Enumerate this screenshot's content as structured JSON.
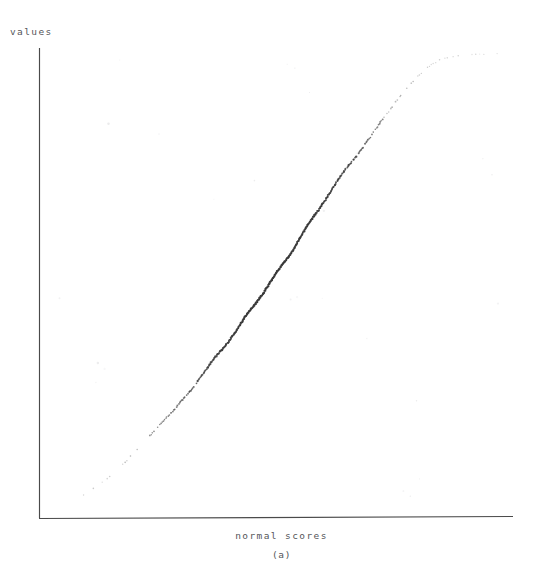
{
  "figure": {
    "caption": "(a)",
    "background_color": "#ffffff",
    "ink_color": "#3a3a3a",
    "axis_color": "#4a4a4a"
  },
  "chart_data": {
    "type": "scatter",
    "title": "",
    "subtitle": "",
    "xlabel": "normal scores",
    "ylabel": "values",
    "annotations": [
      "(a)"
    ],
    "legend": [],
    "legend_position": "none",
    "grid": false,
    "axis_style": "two-sided-open (left spine and bottom spine only, no ticks, no tick labels)",
    "xticks": [],
    "yticks": [],
    "xlim": [
      -3.4,
      3.4
    ],
    "ylim": [
      0,
      1
    ],
    "n_points": 450,
    "marker": "dot",
    "marker_size_px": 1.2,
    "series": [
      {
        "name": "sample quantiles",
        "x": [
          -3.2,
          -3.02,
          -2.86,
          -2.72,
          -2.6,
          -2.49,
          -2.39,
          -2.3,
          -2.22,
          -2.14,
          -2.07,
          -2.0,
          -1.94,
          -1.88,
          -1.82,
          -1.77,
          -1.72,
          -1.67,
          -1.62,
          -1.58,
          -1.53,
          -1.49,
          -1.45,
          -1.41,
          -1.38,
          -1.34,
          -1.3,
          -1.27,
          -1.24,
          -1.2,
          -1.17,
          -1.14,
          -1.11,
          -1.08,
          -1.05,
          -1.02,
          -0.99,
          -0.97,
          -0.94,
          -0.91,
          -0.89,
          -0.86,
          -0.84,
          -0.81,
          -0.79,
          -0.76,
          -0.74,
          -0.72,
          -0.69,
          -0.67,
          -0.65,
          -0.63,
          -0.6,
          -0.58,
          -0.56,
          -0.54,
          -0.52,
          -0.5,
          -0.48,
          -0.46,
          -0.44,
          -0.42,
          -0.4,
          -0.38,
          -0.36,
          -0.34,
          -0.32,
          -0.3,
          -0.28,
          -0.26,
          -0.24,
          -0.22,
          -0.2,
          -0.18,
          -0.16,
          -0.14,
          -0.12,
          -0.1,
          -0.08,
          -0.06,
          -0.04,
          -0.02,
          0.0,
          0.02,
          0.04,
          0.06,
          0.08,
          0.1,
          0.12,
          0.14,
          0.16,
          0.18,
          0.2,
          0.22,
          0.24,
          0.26,
          0.28,
          0.3,
          0.32,
          0.34,
          0.36,
          0.38,
          0.4,
          0.42,
          0.44,
          0.46,
          0.48,
          0.5,
          0.52,
          0.54,
          0.56,
          0.58,
          0.6,
          0.63,
          0.65,
          0.67,
          0.69,
          0.72,
          0.74,
          0.76,
          0.79,
          0.81,
          0.84,
          0.86,
          0.89,
          0.91,
          0.94,
          0.97,
          0.99,
          1.02,
          1.05,
          1.08,
          1.11,
          1.14,
          1.17,
          1.2,
          1.24,
          1.27,
          1.3,
          1.34,
          1.38,
          1.41,
          1.45,
          1.49,
          1.53,
          1.58,
          1.62,
          1.67,
          1.72,
          1.77,
          1.82,
          1.88,
          1.94,
          2.0,
          2.07,
          2.14,
          2.22,
          2.3,
          2.39,
          2.49,
          2.6,
          2.72,
          2.86,
          3.02,
          3.2
        ],
        "y": [
          0.012,
          0.03,
          0.042,
          0.055,
          0.068,
          0.08,
          0.092,
          0.104,
          0.115,
          0.126,
          0.136,
          0.146,
          0.155,
          0.164,
          0.173,
          0.181,
          0.189,
          0.197,
          0.204,
          0.212,
          0.219,
          0.226,
          0.233,
          0.239,
          0.246,
          0.252,
          0.258,
          0.264,
          0.27,
          0.276,
          0.282,
          0.288,
          0.293,
          0.299,
          0.304,
          0.31,
          0.315,
          0.32,
          0.325,
          0.331,
          0.336,
          0.341,
          0.346,
          0.351,
          0.355,
          0.36,
          0.365,
          0.37,
          0.375,
          0.379,
          0.384,
          0.389,
          0.393,
          0.398,
          0.402,
          0.407,
          0.411,
          0.416,
          0.42,
          0.425,
          0.429,
          0.434,
          0.438,
          0.442,
          0.447,
          0.451,
          0.455,
          0.46,
          0.464,
          0.468,
          0.473,
          0.477,
          0.481,
          0.485,
          0.49,
          0.494,
          0.498,
          0.502,
          0.507,
          0.511,
          0.515,
          0.519,
          0.524,
          0.528,
          0.532,
          0.536,
          0.541,
          0.545,
          0.549,
          0.553,
          0.558,
          0.562,
          0.566,
          0.571,
          0.575,
          0.579,
          0.584,
          0.588,
          0.592,
          0.597,
          0.601,
          0.606,
          0.61,
          0.615,
          0.619,
          0.624,
          0.628,
          0.633,
          0.637,
          0.642,
          0.647,
          0.651,
          0.656,
          0.661,
          0.666,
          0.671,
          0.676,
          0.681,
          0.686,
          0.691,
          0.696,
          0.701,
          0.707,
          0.712,
          0.718,
          0.723,
          0.729,
          0.735,
          0.741,
          0.747,
          0.753,
          0.759,
          0.765,
          0.772,
          0.778,
          0.785,
          0.792,
          0.799,
          0.806,
          0.814,
          0.821,
          0.829,
          0.837,
          0.845,
          0.854,
          0.862,
          0.871,
          0.88,
          0.89,
          0.9,
          0.91,
          0.92,
          0.931,
          0.942,
          0.953,
          0.964,
          0.974,
          0.982,
          0.989,
          0.994,
          0.997,
          0.998,
          0.999,
          0.999,
          1.0
        ]
      }
    ]
  }
}
